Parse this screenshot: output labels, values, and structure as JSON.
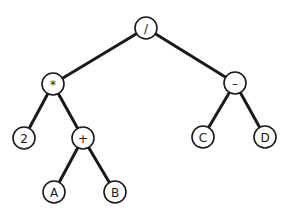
{
  "diagram": {
    "type": "expression-tree",
    "colors": {
      "stroke": "#1a1a1a",
      "node_fill": "#ffffff",
      "background": "#ffffff"
    },
    "node_radius": 11,
    "nodes": [
      {
        "id": "root",
        "label": "/",
        "x": 146,
        "y": 28
      },
      {
        "id": "mul",
        "label": "*",
        "x": 53,
        "y": 84
      },
      {
        "id": "sub",
        "label": "–",
        "x": 235,
        "y": 83
      },
      {
        "id": "two",
        "label": "2",
        "x": 24,
        "y": 138
      },
      {
        "id": "add",
        "label": "+",
        "x": 83,
        "y": 138
      },
      {
        "id": "c",
        "label": "C",
        "x": 203,
        "y": 137
      },
      {
        "id": "d",
        "label": "D",
        "x": 265,
        "y": 137
      },
      {
        "id": "a",
        "label": "A",
        "x": 54,
        "y": 192
      },
      {
        "id": "b",
        "label": "B",
        "x": 115,
        "y": 192
      }
    ],
    "edges": [
      {
        "from": "root",
        "to": "mul"
      },
      {
        "from": "root",
        "to": "sub"
      },
      {
        "from": "mul",
        "to": "two"
      },
      {
        "from": "mul",
        "to": "add"
      },
      {
        "from": "sub",
        "to": "c"
      },
      {
        "from": "sub",
        "to": "d"
      },
      {
        "from": "add",
        "to": "a"
      },
      {
        "from": "add",
        "to": "b"
      }
    ]
  }
}
